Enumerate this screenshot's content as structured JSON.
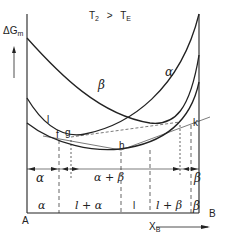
{
  "diagram": {
    "title_parts": {
      "t1": "T",
      "t1_sub": "2",
      "op": ">",
      "t2": "T",
      "t2_sub": "E"
    },
    "y_axis": {
      "label": "ΔG",
      "label_sub": "m"
    },
    "x_axis": {
      "label": "X",
      "label_sub": "B",
      "left_end": "A",
      "right_end": "B"
    },
    "curves": [
      {
        "name": "beta",
        "label": "β"
      },
      {
        "name": "alpha",
        "label": "α"
      },
      {
        "name": "liquid",
        "label": "l"
      }
    ],
    "points": {
      "f": "f",
      "g": "g",
      "h": "h",
      "k": "k",
      "l_mark": "l"
    },
    "upper_regions": [
      "α",
      "α + β",
      "β"
    ],
    "lower_regions": [
      "α",
      "l + α",
      "l",
      "l + β",
      "β"
    ]
  },
  "colors": {
    "line": "#222222",
    "background": "#ffffff"
  }
}
